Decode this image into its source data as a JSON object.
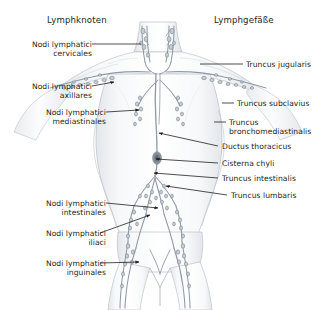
{
  "figure": {
    "width": 318,
    "height": 310,
    "background": "#ffffff",
    "ink": "#231f20",
    "vessel_color": "#8f9aa6",
    "body_fill": "#fbfbfc",
    "body_shadow": "#e7e9ec"
  },
  "headers": {
    "left": "Lymphknoten",
    "right": "Lymphgefäße"
  },
  "labels_left": [
    {
      "id": "cervicales",
      "line1": "Nodi lymphatici",
      "line2": "cervicales",
      "x": 8,
      "y": 40,
      "leader": {
        "type": "line",
        "x1": 92,
        "y1": 44,
        "x2": 141,
        "y2": 44
      }
    },
    {
      "id": "axillares",
      "line1": "Nodi lymphatici",
      "line2": "axillares",
      "x": 8,
      "y": 82,
      "leader": {
        "type": "arrow",
        "x1": 92,
        "y1": 86,
        "x2": 114,
        "y2": 82
      }
    },
    {
      "id": "mediastinales",
      "line1": "Nodi lymphatici",
      "line2": "mediastinales",
      "x": 22,
      "y": 108,
      "leader": {
        "type": "arrow",
        "x1": 106,
        "y1": 112,
        "x2": 139,
        "y2": 110
      }
    },
    {
      "id": "intestinales",
      "line1": "Nodi lymphatici",
      "line2": "intestinales",
      "x": 22,
      "y": 199,
      "leader": {
        "type": "arrow",
        "x1": 106,
        "y1": 203,
        "x2": 158,
        "y2": 208
      }
    },
    {
      "id": "iliaci",
      "line1": "Nodi lymphatici",
      "line2": "iliaci",
      "x": 22,
      "y": 229,
      "leader": {
        "type": "arrow",
        "x1": 100,
        "y1": 233,
        "x2": 150,
        "y2": 215
      }
    },
    {
      "id": "inguinales",
      "line1": "Nodi lymphatici",
      "line2": "inguinales",
      "x": 22,
      "y": 259,
      "leader": {
        "type": "arrow",
        "x1": 100,
        "y1": 263,
        "x2": 139,
        "y2": 262
      }
    }
  ],
  "labels_right": [
    {
      "id": "truncus-jugularis",
      "line1": "Truncus jugularis",
      "line2": "",
      "x": 246,
      "y": 60,
      "leader": {
        "type": "line",
        "x1": 200,
        "y1": 64,
        "x2": 243,
        "y2": 64
      }
    },
    {
      "id": "truncus-subclavius",
      "line1": "Truncus subclavius",
      "line2": "",
      "x": 237,
      "y": 99,
      "leader": {
        "type": "line",
        "x1": 222,
        "y1": 103,
        "x2": 234,
        "y2": 103
      }
    },
    {
      "id": "truncus-bronchomediastinalis",
      "line1": "Truncus",
      "line2": "bronchomediastinalis",
      "x": 229,
      "y": 118,
      "leader": {
        "type": "line",
        "x1": 214,
        "y1": 122,
        "x2": 226,
        "y2": 122
      }
    },
    {
      "id": "ductus-thoracicus",
      "line1": "Ductus thoracicus",
      "line2": "",
      "x": 222,
      "y": 142,
      "leader": {
        "type": "arrow",
        "x1": 218,
        "y1": 146,
        "x2": 159,
        "y2": 133
      }
    },
    {
      "id": "cisterna-chyli",
      "line1": "Cisterna chyli",
      "line2": "",
      "x": 222,
      "y": 159,
      "leader": {
        "type": "arrow",
        "x1": 218,
        "y1": 163,
        "x2": 156,
        "y2": 159
      }
    },
    {
      "id": "truncus-intestinalis",
      "line1": "Truncus intestinalis",
      "line2": "",
      "x": 222,
      "y": 174,
      "leader": {
        "type": "arrow",
        "x1": 218,
        "y1": 178,
        "x2": 154,
        "y2": 173
      }
    },
    {
      "id": "truncus-lumbaris",
      "line1": "Truncus lumbaris",
      "line2": "",
      "x": 231,
      "y": 191,
      "leader": {
        "type": "arrow",
        "x1": 227,
        "y1": 195,
        "x2": 166,
        "y2": 186
      }
    }
  ],
  "anatomy": {
    "regions": [
      "neck",
      "clavicle",
      "axilla-left",
      "axilla-right",
      "mediastinum",
      "abdomen",
      "pelvis",
      "inguinal",
      "thighs"
    ],
    "node_clusters": [
      "cervical-left",
      "cervical-right",
      "axillary-left",
      "axillary-right",
      "mediastinal-left",
      "mediastinal-right",
      "intestinal",
      "iliac-left",
      "iliac-right",
      "inguinal-left",
      "inguinal-right"
    ],
    "trunks": [
      "truncus-jugularis",
      "truncus-subclavius",
      "truncus-bronchomediastinalis",
      "ductus-thoracicus",
      "cisterna-chyli",
      "truncus-intestinalis",
      "truncus-lumbaris"
    ]
  }
}
